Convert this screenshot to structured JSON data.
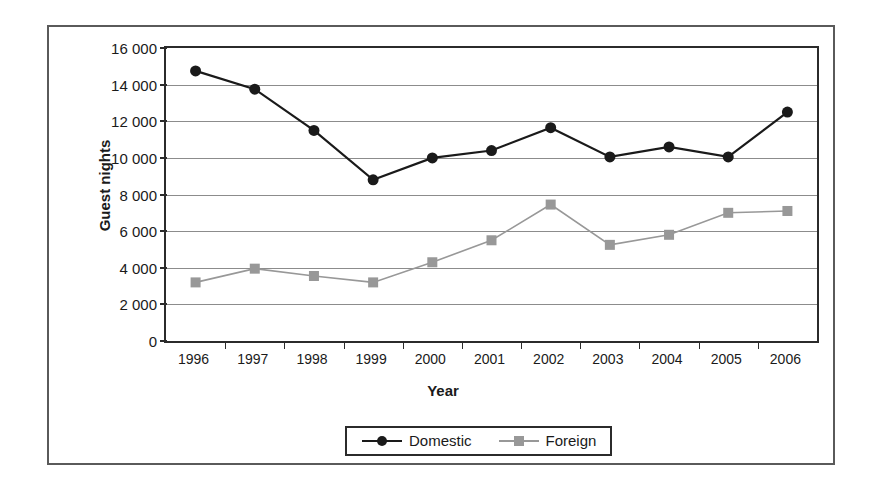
{
  "chart_data": {
    "type": "line",
    "title": "",
    "xlabel": "Year",
    "ylabel": "Guest nights",
    "categories": [
      "1996",
      "1997",
      "1998",
      "1999",
      "2000",
      "2001",
      "2002",
      "2003",
      "2004",
      "2005",
      "2006"
    ],
    "ylim": [
      0,
      16000
    ],
    "yticks": [
      0,
      2000,
      4000,
      6000,
      8000,
      10000,
      12000,
      14000,
      16000
    ],
    "ytick_labels": [
      "0",
      "2 000",
      "4 000",
      "6 000",
      "8 000",
      "10 000",
      "12 000",
      "14 000",
      "16 000"
    ],
    "grid": true,
    "legend_position": "bottom-center",
    "series": [
      {
        "name": "Domestic",
        "color": "#1a1a1a",
        "marker": "circle",
        "values": [
          14750,
          13750,
          11500,
          8800,
          10000,
          10400,
          11650,
          10050,
          10600,
          10050,
          12500
        ]
      },
      {
        "name": "Foreign",
        "color": "#989898",
        "marker": "square",
        "values": [
          3200,
          3950,
          3550,
          3200,
          4300,
          5500,
          7450,
          5250,
          5800,
          7000,
          7100
        ]
      }
    ]
  },
  "legend": {
    "entries": [
      {
        "label": "Domestic"
      },
      {
        "label": "Foreign"
      }
    ]
  },
  "colors": {
    "domestic": "#1a1a1a",
    "foreign": "#989898",
    "axis": "#2b2b2b",
    "grid": "#8c8c8c",
    "frame": "#5a5a5a"
  }
}
